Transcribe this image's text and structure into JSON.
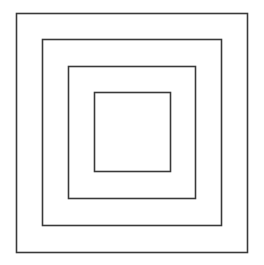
{
  "diagram": {
    "type": "concentric-squares",
    "background": "#ffffff",
    "stroke_color": "#3a3a3a",
    "stroke_width": 1.6,
    "squares": [
      {
        "name": "outer-square",
        "x": 16.5,
        "y": 13.5,
        "w": 231,
        "h": 239
      },
      {
        "name": "second-square",
        "x": 42.5,
        "y": 39.5,
        "w": 179,
        "h": 186
      },
      {
        "name": "third-square",
        "x": 68.5,
        "y": 66.5,
        "w": 127,
        "h": 132
      },
      {
        "name": "inner-square",
        "x": 94.5,
        "y": 92.5,
        "w": 76,
        "h": 79
      }
    ]
  }
}
